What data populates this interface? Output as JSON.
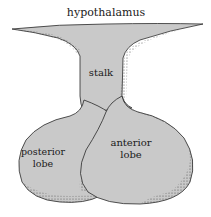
{
  "diagram": {
    "title_label": "hypothalamus",
    "labels": {
      "stalk": "stalk",
      "posterior_line1": "posterior",
      "posterior_line2": "lobe",
      "anterior_line1": "anterior",
      "anterior_line2": "lobe"
    },
    "colors": {
      "fill": "#c9c9c9",
      "outline": "#2a2a2a",
      "stipple": "#3a3a3a",
      "background": "#ffffff"
    }
  }
}
